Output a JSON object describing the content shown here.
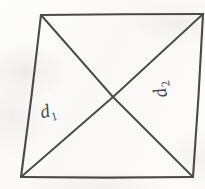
{
  "figure": {
    "kind": "hand-drawn-geometry-diagram",
    "ink_color": "#4c4a48",
    "paper_color": "#fcfbfa",
    "canvas": {
      "width": 205,
      "height": 189
    },
    "shape": {
      "name": "quadrilateral",
      "vertices": [
        {
          "name": "top-left",
          "x": 41,
          "y": 15
        },
        {
          "name": "top-right",
          "x": 203,
          "y": 14
        },
        {
          "name": "bottom-right",
          "x": 193,
          "y": 177
        },
        {
          "name": "bottom-left",
          "x": 21,
          "y": 177
        }
      ],
      "edges": [
        {
          "name": "top-edge",
          "from": "top-left",
          "to": "top-right"
        },
        {
          "name": "right-edge",
          "from": "top-right",
          "to": "bottom-right"
        },
        {
          "name": "bottom-edge",
          "from": "bottom-right",
          "to": "bottom-left"
        },
        {
          "name": "left-edge",
          "from": "bottom-left",
          "to": "top-left"
        }
      ]
    },
    "diagonals": [
      {
        "id": "d1",
        "label": "d",
        "subscript": "1",
        "from": "bottom-left",
        "to": "top-right",
        "label_position": {
          "x": 38,
          "y": 103
        },
        "label_rotation_deg": -14
      },
      {
        "id": "d2",
        "label": "d",
        "subscript": "2",
        "from": "top-left",
        "to": "bottom-right",
        "label_position": {
          "x": 152,
          "y": 100
        },
        "label_rotation_deg": -104
      }
    ],
    "intersection": {
      "name": "diagonal-intersection",
      "x": 113,
      "y": 97
    }
  }
}
